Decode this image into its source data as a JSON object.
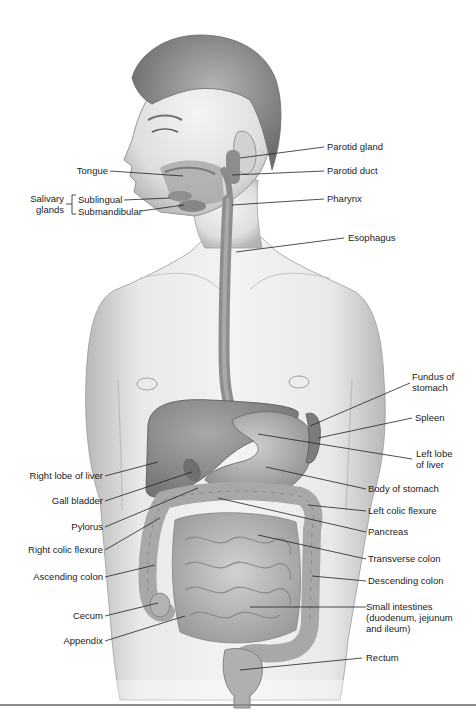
{
  "diagram": {
    "colors": {
      "skin": "#e6e6e6",
      "skin_shade": "#b9b9b9",
      "hair": "#8c8c8c",
      "organ": "#9a9a9a",
      "organ_dark": "#7a7a7a",
      "intestine": "#bdbdbd",
      "leader": "#222222",
      "rule": "#8a8a8a"
    },
    "labels_left": [
      {
        "id": "tongue",
        "text": "Tongue"
      },
      {
        "id": "salivary-glands",
        "text": "Salivary\nglands"
      },
      {
        "id": "sublingual",
        "text": "Sublingual"
      },
      {
        "id": "submandibular",
        "text": "Submandibular"
      },
      {
        "id": "right-lobe-liver",
        "text": "Right lobe of liver"
      },
      {
        "id": "gall-bladder",
        "text": "Gall bladder"
      },
      {
        "id": "pylorus",
        "text": "Pylorus"
      },
      {
        "id": "right-colic-flexure",
        "text": "Right colic flexure"
      },
      {
        "id": "ascending-colon",
        "text": "Ascending colon"
      },
      {
        "id": "cecum",
        "text": "Cecum"
      },
      {
        "id": "appendix",
        "text": "Appendix"
      }
    ],
    "labels_right": [
      {
        "id": "parotid-gland",
        "text": "Parotid gland"
      },
      {
        "id": "parotid-duct",
        "text": "Parotid duct"
      },
      {
        "id": "pharynx",
        "text": "Pharynx"
      },
      {
        "id": "esophagus",
        "text": "Esophagus"
      },
      {
        "id": "fundus-stomach",
        "text": "Fundus of\nstomach"
      },
      {
        "id": "spleen",
        "text": "Spleen"
      },
      {
        "id": "left-lobe-liver",
        "text": "Left lobe\nof liver"
      },
      {
        "id": "body-stomach",
        "text": "Body of stomach"
      },
      {
        "id": "left-colic-flexure",
        "text": "Left colic flexure"
      },
      {
        "id": "pancreas",
        "text": "Pancreas"
      },
      {
        "id": "transverse-colon",
        "text": "Transverse colon"
      },
      {
        "id": "descending-colon",
        "text": "Descending colon"
      },
      {
        "id": "small-intestines",
        "text": "Small intestines\n(duodenum, jejunum\nand ileum)"
      },
      {
        "id": "rectum",
        "text": "Rectum"
      }
    ]
  }
}
